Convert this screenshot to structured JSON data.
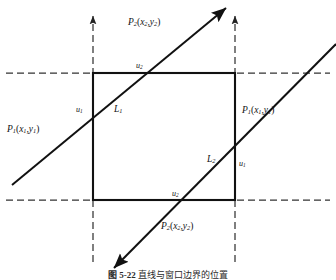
{
  "figure": {
    "domain": "geometry-diagram",
    "title_caption": "图 5-22   直线与窗口边界的位置",
    "caption_number": "图 5-22",
    "caption_text": "直线与窗口边界的位置",
    "background_color": "#ffffff",
    "line_color": "#111111",
    "dashed_color": "#333333"
  },
  "labels": {
    "p2_top": {
      "name": "P",
      "sub": "2",
      "args_x": "x",
      "args_x_sub": "2",
      "args_y": "y",
      "args_y_sub": "2"
    },
    "p1_left": {
      "name": "P",
      "sub": "1",
      "args_x": "x",
      "args_x_sub": "1",
      "args_y": "y",
      "args_y_sub": "1"
    },
    "p1_right": {
      "name": "P",
      "sub": "1",
      "args_x": "x",
      "args_x_sub": "1",
      "args_y": "y",
      "args_y_sub": "1"
    },
    "p2_bottom": {
      "name": "P",
      "sub": "2",
      "args_x": "x",
      "args_x_sub": "2",
      "args_y": "y",
      "args_y_sub": "2"
    },
    "u2_top": {
      "name": "u",
      "sub": "2"
    },
    "u1_left": {
      "name": "u",
      "sub": "1"
    },
    "u1_right": {
      "name": "u",
      "sub": "1"
    },
    "u2_bottom": {
      "name": "u",
      "sub": "2"
    },
    "l1": {
      "name": "L",
      "sub": "1"
    },
    "l2": {
      "name": "L",
      "sub": "2"
    }
  },
  "geometry": {
    "window_rect": {
      "x": 93,
      "y": 73,
      "width": 142,
      "height": 127
    },
    "dashed_horizontal_top_y": 73,
    "dashed_horizontal_bottom_y": 200,
    "dashed_vertical_left_x": 93,
    "dashed_vertical_right_x": 235,
    "line_L1": {
      "x1": 12,
      "y1": 185,
      "x2": 228,
      "y2": 6,
      "arrow": "end"
    },
    "line_L2": {
      "x1": 336,
      "y1": 46,
      "x2": 112,
      "y2": 270,
      "arrow": "end"
    },
    "intersections": {
      "L1_top_edge": {
        "x": 143,
        "y": 73
      },
      "L1_left_edge": {
        "x": 93,
        "y": 114
      },
      "L2_right_edge": {
        "x": 235,
        "y": 148
      },
      "L2_bottom_edge": {
        "x": 182,
        "y": 200
      }
    }
  }
}
